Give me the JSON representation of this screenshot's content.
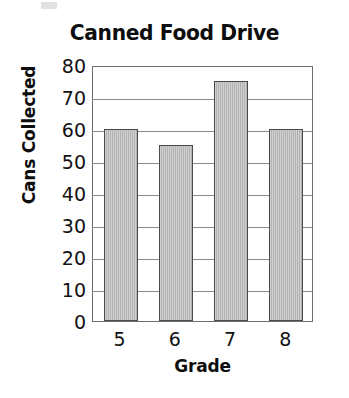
{
  "chart_data": {
    "type": "bar",
    "title": "Canned Food Drive",
    "xlabel": "Grade",
    "ylabel": "Cans Collected",
    "categories": [
      "5",
      "6",
      "7",
      "8"
    ],
    "values": [
      60,
      55,
      75,
      60
    ],
    "ylim": [
      0,
      80
    ],
    "ytick_labels": [
      "80",
      "70",
      "60",
      "50",
      "40",
      "30",
      "20",
      "10",
      "0"
    ],
    "ytick_values": [
      80,
      70,
      60,
      50,
      40,
      30,
      20,
      10,
      0
    ],
    "ytick_step": 10,
    "grid": true,
    "grid_axis": "y",
    "legend": false,
    "legend_position": "none",
    "colors": {
      "bar_fill": "#bcbcbc",
      "bar_edge": "#4a4a4a",
      "grid": "#8a8a8a",
      "plot_border": "#6e6e6e",
      "text": "#121212",
      "background": "#ffffff"
    }
  }
}
